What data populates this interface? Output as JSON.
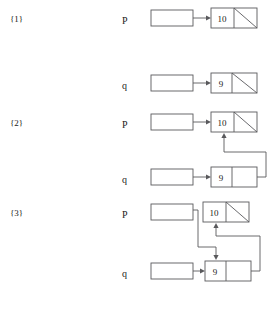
{
  "figure": {
    "steps": [
      {
        "id": "step-1",
        "label": "{1}",
        "label_y": 22,
        "rows": [
          {
            "id": "s1-p",
            "pointer": "P",
            "pointer_x": 122,
            "pointer_y": 24,
            "var_box": {
              "x": 151,
              "y": 10,
              "w": 42,
              "h": 16
            },
            "arrow": {
              "x1": 193,
              "y1": 18,
              "x2": 211,
              "y2": 18
            },
            "node": {
              "x": 211,
              "y": 8,
              "w": 46,
              "h": 20,
              "value": "10",
              "value_x": 222,
              "value_y": 22,
              "divider_x": 234,
              "null_slash": true
            }
          }
        ]
      },
      {
        "id": "step-2",
        "label": "{2}",
        "label_y": 126,
        "rows": [
          {
            "id": "s2-q-top",
            "pointer": "q",
            "pointer_x": 122,
            "pointer_y": 89,
            "var_box": {
              "x": 151,
              "y": 75,
              "w": 42,
              "h": 16
            },
            "arrow": {
              "x1": 193,
              "y1": 83,
              "x2": 211,
              "y2": 83
            },
            "node": {
              "x": 211,
              "y": 73,
              "w": 46,
              "h": 20,
              "value": "9",
              "value_x": 221,
              "value_y": 87,
              "divider_x": 232,
              "null_slash": true
            }
          },
          {
            "id": "s2-p",
            "pointer": "P",
            "pointer_x": 122,
            "pointer_y": 128,
            "var_box": {
              "x": 151,
              "y": 114,
              "w": 42,
              "h": 16
            },
            "arrow": {
              "x1": 193,
              "y1": 122,
              "x2": 211,
              "y2": 122
            },
            "node": {
              "x": 211,
              "y": 112,
              "w": 46,
              "h": 20,
              "value": "10",
              "value_x": 222,
              "value_y": 126,
              "divider_x": 234,
              "null_slash": true
            }
          },
          {
            "id": "s2-q-bottom",
            "pointer": "q",
            "pointer_x": 122,
            "pointer_y": 183,
            "var_box": {
              "x": 151,
              "y": 169,
              "w": 42,
              "h": 16
            },
            "arrow": {
              "x1": 193,
              "y1": 177,
              "x2": 211,
              "y2": 177
            },
            "node": {
              "x": 211,
              "y": 167,
              "w": 46,
              "h": 20,
              "value": "9",
              "value_x": 221,
              "value_y": 181,
              "divider_x": 232,
              "null_slash": false
            }
          }
        ],
        "links": [
          {
            "id": "s2-next-link",
            "desc": "next pointer of node 9 routed up into node 10",
            "path": "M 257 177 L 266 177 L 266 152 L 224 152 L 224 136",
            "arrow_at": {
              "x": 224,
              "y": 133,
              "dir": "up"
            }
          }
        ]
      },
      {
        "id": "step-3",
        "label": "{3}",
        "label_y": 216,
        "rows": [
          {
            "id": "s3-p",
            "pointer": "P",
            "pointer_x": 122,
            "pointer_y": 218,
            "var_box": {
              "x": 151,
              "y": 204,
              "w": 42,
              "h": 16
            },
            "arrow": null,
            "node": {
              "x": 203,
              "y": 202,
              "w": 46,
              "h": 20,
              "value": "10",
              "value_x": 214,
              "value_y": 216,
              "divider_x": 226,
              "null_slash": true
            }
          },
          {
            "id": "s3-q",
            "pointer": "q",
            "pointer_x": 122,
            "pointer_y": 277,
            "var_box": {
              "x": 151,
              "y": 263,
              "w": 42,
              "h": 16
            },
            "arrow": {
              "x1": 193,
              "y1": 271,
              "x2": 205,
              "y2": 271
            },
            "node": {
              "x": 205,
              "y": 261,
              "w": 46,
              "h": 20,
              "value": "9",
              "value_x": 215,
              "value_y": 275,
              "divider_x": 226,
              "null_slash": false
            }
          }
        ],
        "links": [
          {
            "id": "s3-p-link",
            "desc": "p routed down and right to point at node 9",
            "path": "M 193 210 L 198 210 L 198 247 L 216 247 L 216 257",
            "arrow_at": {
              "x": 216,
              "y": 260,
              "dir": "down"
            }
          },
          {
            "id": "s3-next-link",
            "desc": "next pointer of node 9 routed up into node 10",
            "path": "M 251 271 L 260 271 L 260 236 L 216 236 L 216 226",
            "arrow_at": {
              "x": 216,
              "y": 223,
              "dir": "up"
            }
          }
        ]
      }
    ],
    "colors": {
      "stroke": "#59595c",
      "text": "#1a1a1a",
      "background": "#ffffff"
    }
  }
}
